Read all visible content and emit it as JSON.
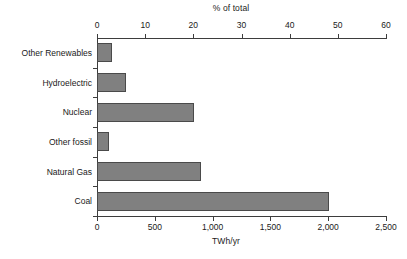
{
  "chart_data": {
    "type": "bar",
    "orientation": "horizontal",
    "title": "",
    "categories": [
      "Other Renewables",
      "Hydroelectric",
      "Nuclear",
      "Other fossil",
      "Natural Gas",
      "Coal"
    ],
    "values": [
      130,
      250,
      835,
      100,
      900,
      2010
    ],
    "xlabel": "TWh/yr",
    "ylabel": "",
    "xlim": [
      0,
      2500
    ],
    "xticks": [
      0,
      500,
      1000,
      1500,
      2000,
      2500
    ],
    "xticklabels": [
      "0",
      "500",
      "1,000",
      "1,500",
      "2,000",
      "2,500"
    ],
    "secondary_axis": {
      "position": "top",
      "label": "% of total",
      "lim": [
        0,
        60
      ],
      "ticks": [
        0,
        10,
        20,
        30,
        40,
        50,
        60
      ],
      "ticklabels": [
        "0",
        "10",
        "20",
        "30",
        "40",
        "50",
        "60"
      ]
    },
    "grid": false,
    "legend": null,
    "bar_color": "#808080",
    "bar_edge_color": "#4a4a4a",
    "background_color": "#ffffff",
    "text_color": "#1a1a1a"
  }
}
